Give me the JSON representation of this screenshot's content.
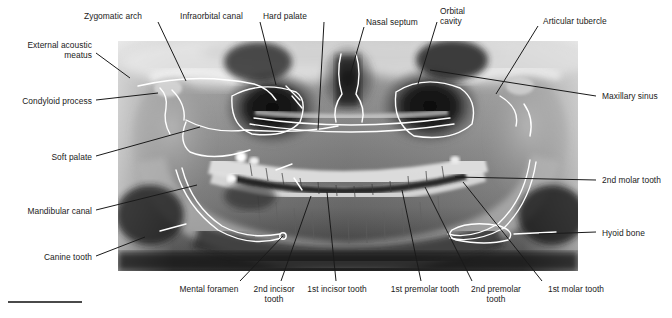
{
  "figure": {
    "type": "annotated-radiograph",
    "modality": "panoramic dental radiograph (orthopantomogram)",
    "image": {
      "x": 118,
      "y": 41,
      "width": 460,
      "height": 230,
      "description": "Grayscale panoramic X-ray of the skull showing maxilla, mandible, full dental arches, maxillary sinuses and temporomandibular joints, with white hand-drawn anatomical tracing overlays."
    },
    "colors": {
      "background": "#ffffff",
      "label_text": "#1a1a1a",
      "leader_line": "#1a1a1a",
      "tracing_overlay": "#ffffff",
      "rule": "#4a4a4a"
    },
    "rule": {
      "x": 8,
      "y": 301,
      "width": 74,
      "height": 2
    }
  },
  "labels": [
    {
      "id": "external-acoustic-meatus",
      "text": "External acoustic\nmeatus",
      "align": "right",
      "tx": 16,
      "ty": 40,
      "tw": 76,
      "line": [
        [
          96,
          53
        ],
        [
          130,
          78
        ]
      ]
    },
    {
      "id": "zygomatic-arch",
      "text": "Zygomatic arch",
      "align": "left",
      "tx": 84,
      "ty": 11,
      "tw": 72,
      "line": [
        [
          158,
          22
        ],
        [
          186,
          81
        ]
      ]
    },
    {
      "id": "infraorbital-canal",
      "text": "Infraorbital canal",
      "align": "left",
      "tx": 180,
      "ty": 11,
      "tw": 78,
      "line": [
        [
          260,
          22
        ],
        [
          276,
          85
        ]
      ]
    },
    {
      "id": "hard-palate",
      "text": "Hard palate",
      "align": "left",
      "tx": 263,
      "ty": 11,
      "tw": 58,
      "line": [
        [
          324,
          22
        ],
        [
          318,
          130
        ]
      ]
    },
    {
      "id": "nasal-septum",
      "text": "Nasal septum",
      "align": "left",
      "tx": 366,
      "ty": 17,
      "tw": 66,
      "line": [
        [
          364,
          27
        ],
        [
          347,
          86
        ]
      ]
    },
    {
      "id": "orbital-cavity",
      "text": "Orbital\ncavity",
      "align": "left",
      "tx": 440,
      "ty": 6,
      "tw": 38,
      "line": [
        [
          437,
          22
        ],
        [
          418,
          84
        ]
      ]
    },
    {
      "id": "articular-tubercle",
      "text": "Articular tubercle",
      "align": "left",
      "tx": 543,
      "ty": 16,
      "tw": 84,
      "line": [
        [
          538,
          26
        ],
        [
          496,
          94
        ]
      ]
    },
    {
      "id": "maxillary-sinus",
      "text": "Maxillary sinus",
      "align": "left",
      "tx": 602,
      "ty": 91,
      "tw": 70,
      "line": [
        [
          596,
          96
        ],
        [
          430,
          70
        ]
      ]
    },
    {
      "id": "condyloid-process",
      "text": "Condyloid process",
      "align": "right",
      "tx": 14,
      "ty": 96,
      "tw": 78,
      "line": [
        [
          96,
          100
        ],
        [
          158,
          93
        ]
      ]
    },
    {
      "id": "soft-palate",
      "text": "Soft palate",
      "align": "right",
      "tx": 44,
      "ty": 152,
      "tw": 48,
      "line": [
        [
          96,
          156
        ],
        [
          200,
          127
        ]
      ]
    },
    {
      "id": "mandibular-canal",
      "text": "Mandibular canal",
      "align": "right",
      "tx": 16,
      "ty": 206,
      "tw": 76,
      "line": [
        [
          96,
          210
        ],
        [
          197,
          185
        ]
      ]
    },
    {
      "id": "canine-tooth",
      "text": "Canine tooth",
      "align": "right",
      "tx": 36,
      "ty": 252,
      "tw": 56,
      "line": [
        [
          96,
          256
        ],
        [
          145,
          237
        ]
      ]
    },
    {
      "id": "2nd-molar-tooth",
      "text": "2nd molar tooth",
      "align": "left",
      "tx": 602,
      "ty": 175,
      "tw": 72,
      "line": [
        [
          596,
          180
        ],
        [
          455,
          177
        ]
      ]
    },
    {
      "id": "hyoid-bone",
      "text": "Hyoid bone",
      "align": "left",
      "tx": 602,
      "ty": 228,
      "tw": 54,
      "line": [
        [
          596,
          232
        ],
        [
          539,
          234
        ]
      ]
    },
    {
      "id": "mental-foramen",
      "text": "Mental foramen",
      "align": "center",
      "tx": 174,
      "ty": 284,
      "tw": 70,
      "line": [
        [
          240,
          281
        ],
        [
          283,
          236
        ]
      ]
    },
    {
      "id": "2nd-incisor-tooth",
      "text": "2nd incisor\ntooth",
      "align": "center",
      "tx": 247,
      "ty": 284,
      "tw": 54,
      "line": [
        [
          281,
          281
        ],
        [
          311,
          196
        ]
      ]
    },
    {
      "id": "1st-incisor-tooth",
      "text": "1st incisor tooth",
      "align": "center",
      "tx": 300,
      "ty": 284,
      "tw": 74,
      "line": [
        [
          336,
          281
        ],
        [
          327,
          192
        ]
      ]
    },
    {
      "id": "1st-premolar-tooth",
      "text": "1st premolar tooth",
      "align": "center",
      "tx": 383,
      "ty": 284,
      "tw": 84,
      "line": [
        [
          421,
          281
        ],
        [
          402,
          190
        ]
      ]
    },
    {
      "id": "2nd-premolar-tooth",
      "text": "2nd premolar\ntooth",
      "align": "center",
      "tx": 464,
      "ty": 284,
      "tw": 64,
      "line": [
        [
          472,
          281
        ],
        [
          425,
          187
        ]
      ]
    },
    {
      "id": "1st-molar-tooth",
      "text": "1st molar tooth",
      "align": "center",
      "tx": 540,
      "ty": 284,
      "tw": 72,
      "line": [
        [
          542,
          281
        ],
        [
          463,
          182
        ]
      ]
    }
  ]
}
